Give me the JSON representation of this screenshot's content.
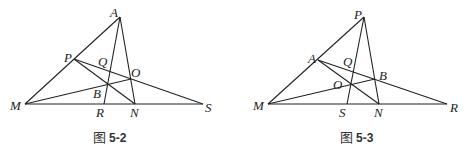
{
  "figures": [
    {
      "id": "fig-5-2",
      "caption_prefix": "图",
      "caption_number": "5-2",
      "points": {
        "M": {
          "label": "M",
          "x": 25,
          "y": 104
        },
        "A": {
          "label": "A",
          "x": 120,
          "y": 17
        },
        "P": {
          "label": "P",
          "x": 74,
          "y": 59
        },
        "Q": {
          "label": "Q",
          "x": 111,
          "y": 70
        },
        "O": {
          "label": "O",
          "x": 131,
          "y": 79
        },
        "B": {
          "label": "B",
          "x": 107,
          "y": 84
        },
        "R": {
          "label": "R",
          "x": 104,
          "y": 104
        },
        "N": {
          "label": "N",
          "x": 135,
          "y": 104
        },
        "S": {
          "label": "S",
          "x": 203,
          "y": 104
        }
      },
      "segments": [
        [
          "M",
          "A"
        ],
        [
          "M",
          "S"
        ],
        [
          "A",
          "R"
        ],
        [
          "A",
          "N"
        ],
        [
          "P",
          "S"
        ],
        [
          "P",
          "N"
        ],
        [
          "M",
          "O"
        ]
      ]
    },
    {
      "id": "fig-5-3",
      "caption_prefix": "图",
      "caption_number": "5-3",
      "points": {
        "M": {
          "label": "M",
          "x": 268,
          "y": 104
        },
        "P": {
          "label": "P",
          "x": 364,
          "y": 17
        },
        "A": {
          "label": "A",
          "x": 318,
          "y": 60
        },
        "Q": {
          "label": "Q",
          "x": 354,
          "y": 72
        },
        "O": {
          "label": "O",
          "x": 351,
          "y": 84
        },
        "B": {
          "label": "B",
          "x": 375,
          "y": 79
        },
        "S": {
          "label": "S",
          "x": 347,
          "y": 104
        },
        "N": {
          "label": "N",
          "x": 379,
          "y": 104
        },
        "R": {
          "label": "R",
          "x": 447,
          "y": 104
        }
      },
      "segments": [
        [
          "M",
          "P"
        ],
        [
          "M",
          "R"
        ],
        [
          "P",
          "S"
        ],
        [
          "P",
          "N"
        ],
        [
          "A",
          "R"
        ],
        [
          "A",
          "N"
        ],
        [
          "M",
          "B"
        ]
      ]
    }
  ],
  "labels": {
    "f1": {
      "M": "M",
      "A": "A",
      "P": "P",
      "Q": "Q",
      "O": "O",
      "B": "B",
      "R": "R",
      "N": "N",
      "S": "S",
      "cap_prefix": "图",
      "cap_num": "5-2"
    },
    "f2": {
      "M": "M",
      "P": "P",
      "A": "A",
      "Q": "Q",
      "O": "O",
      "B": "B",
      "S": "S",
      "N": "N",
      "R": "R",
      "cap_prefix": "图",
      "cap_num": "5-3"
    }
  }
}
